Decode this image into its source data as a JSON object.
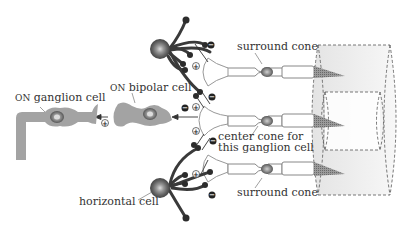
{
  "labels": {
    "surround_cone_top": "surround cone",
    "surround_cone_bottom": "surround cone",
    "center_cone_line1": "center cone for",
    "center_cone_line2": "this ganglion cell",
    "bipolar_prefix": "ON",
    "bipolar_rest": " bipolar cell",
    "ganglion_prefix": "ON",
    "ganglion_rest": " ganglion cell",
    "horizontal_cell": "horizontal cell"
  },
  "signs": {
    "plus": "+",
    "minus": "−"
  },
  "colors": {
    "cell_gray": "#a3a3a3",
    "cell_dark": "#5a5a5a",
    "horizontal_dark": "#3a3a3a",
    "cone_outline": "#888888",
    "receptive_field": "#e4e4e4",
    "text": "#333333"
  }
}
